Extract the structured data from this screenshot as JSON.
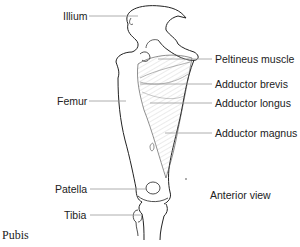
{
  "diagram": {
    "view_label": "Anterior view",
    "caption": "Pubis",
    "left_labels": [
      {
        "id": "illium",
        "text": "Illium"
      },
      {
        "id": "femur",
        "text": "Femur"
      },
      {
        "id": "patella",
        "text": "Patella"
      },
      {
        "id": "tibia",
        "text": "Tibia"
      }
    ],
    "right_labels": [
      {
        "id": "peltineus",
        "text": "Peltineus muscle"
      },
      {
        "id": "adductor-brevis",
        "text": "Adductor brevis"
      },
      {
        "id": "adductor-longus",
        "text": "Adductor longus"
      },
      {
        "id": "adductor-magnus",
        "text": "Adductor magnus"
      }
    ],
    "colors": {
      "outline": "#222222",
      "leader_line": "#9a9a9a",
      "muscle_hatch": "#bdbdbd",
      "text": "#222222"
    }
  }
}
